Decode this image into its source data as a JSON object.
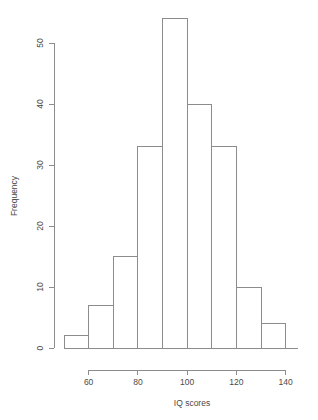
{
  "chart_data": {
    "type": "bar",
    "title": "",
    "subtitle": "",
    "xlabel": "IQ scores",
    "ylabel": "Frequency",
    "bin_width": 10,
    "bin_edges": [
      50,
      60,
      70,
      80,
      90,
      100,
      110,
      120,
      130,
      140,
      145
    ],
    "categories": [
      "50-60",
      "60-70",
      "70-80",
      "80-90",
      "90-100",
      "100-110",
      "110-120",
      "120-130",
      "130-140",
      "140-145"
    ],
    "values": [
      2,
      7,
      15,
      33,
      54,
      40,
      33,
      10,
      4,
      0
    ],
    "xlim": [
      50,
      145
    ],
    "ylim": [
      0,
      54
    ],
    "xticks": [
      60,
      80,
      100,
      120,
      140
    ],
    "xtick_labels": [
      "60",
      "80",
      "100",
      "120",
      "140"
    ],
    "yticks": [
      0,
      10,
      20,
      30,
      40,
      50
    ],
    "ytick_labels": [
      "0",
      "10",
      "20",
      "30",
      "40",
      "50"
    ],
    "grid": false,
    "legend": null,
    "bar_fill": "#ffffff",
    "bar_stroke": "#8c8c8c",
    "axis_color": "#8c8c8c",
    "text_color": "#4a4a4a",
    "background": "#ffffff"
  },
  "axes": {
    "y_title": "Frequency",
    "x_title": "IQ scores"
  }
}
